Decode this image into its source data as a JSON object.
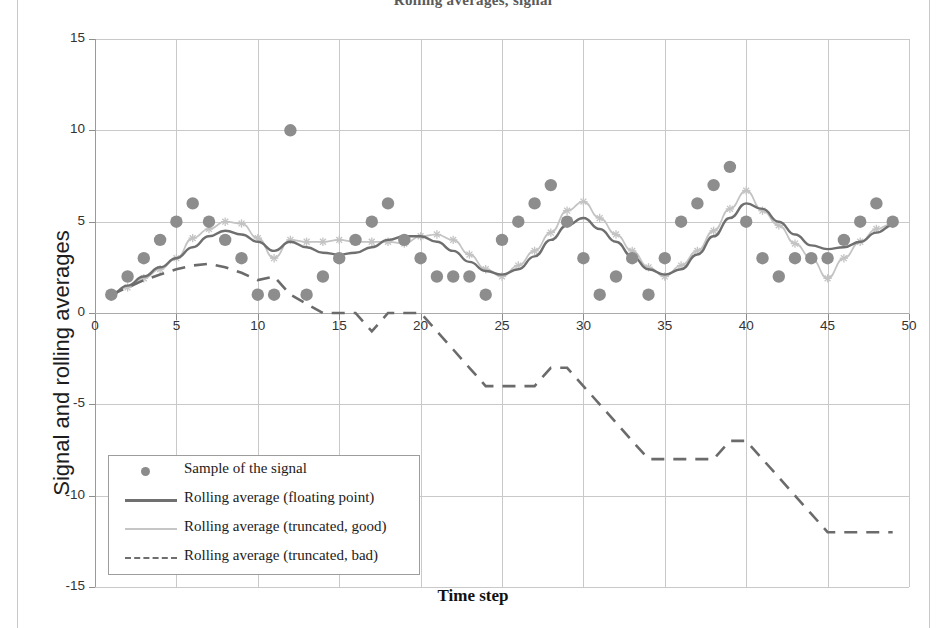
{
  "page": {
    "title_partial": "Rolling averages, signal",
    "background": "#ffffff"
  },
  "axis_labels": {
    "y": "Signal and rolling averages",
    "x": "Time step"
  },
  "legend": {
    "items": [
      {
        "label": "Sample of the signal",
        "key": "marker-dot",
        "color": "#8d8d8d"
      },
      {
        "label": "Rolling average (floating point)",
        "key": "line-solid",
        "color": "#6f6f6f"
      },
      {
        "label": "Rolling average (truncated, good)",
        "key": "line-light",
        "color": "#c3c3c3"
      },
      {
        "label": "Rolling average (truncated, bad)",
        "key": "line-dashed",
        "color": "#6b6b6b"
      }
    ]
  },
  "ticks": {
    "y": [
      "15",
      "10",
      "5",
      "0",
      "-5",
      "-10",
      "-15"
    ],
    "x": [
      "0",
      "5",
      "10",
      "15",
      "20",
      "25",
      "30",
      "35",
      "40",
      "45",
      "50"
    ]
  },
  "chart_data": {
    "type": "scatter",
    "title": "Rolling averages, signal",
    "xlabel": "Time step",
    "ylabel": "Signal and rolling averages",
    "xlim": [
      0,
      50
    ],
    "ylim": [
      -15,
      15
    ],
    "xticks": [
      0,
      5,
      10,
      15,
      20,
      25,
      30,
      35,
      40,
      45,
      50
    ],
    "yticks": [
      -15,
      -10,
      -5,
      0,
      5,
      10,
      15
    ],
    "grid": true,
    "legend_position": "lower-left-inside",
    "x": [
      1,
      2,
      3,
      4,
      5,
      6,
      7,
      8,
      9,
      10,
      11,
      12,
      13,
      14,
      15,
      16,
      17,
      18,
      19,
      20,
      21,
      22,
      23,
      24,
      25,
      26,
      27,
      28,
      29,
      30,
      31,
      32,
      33,
      34,
      35,
      36,
      37,
      38,
      39,
      40,
      41,
      42,
      43,
      44,
      45,
      46,
      47,
      48,
      49
    ],
    "series": [
      {
        "name": "Sample of the signal",
        "type": "scatter",
        "marker": "circle",
        "color": "#8d8d8d",
        "values": [
          1,
          2,
          3,
          4,
          5,
          6,
          5,
          4,
          3,
          1,
          1,
          10,
          1,
          2,
          3,
          4,
          5,
          6,
          4,
          3,
          2,
          2,
          2,
          1,
          4,
          5,
          6,
          7,
          5,
          3,
          1,
          2,
          3,
          1,
          3,
          5,
          6,
          7,
          8,
          5,
          3,
          2,
          3,
          3,
          3,
          4,
          5,
          6,
          5
        ]
      },
      {
        "name": "Rolling average (floating point)",
        "type": "line",
        "color": "#6f6f6f",
        "values": [
          1.0,
          1.5,
          2.0,
          2.5,
          3.0,
          3.6,
          4.2,
          4.5,
          4.3,
          3.9,
          3.4,
          3.9,
          3.6,
          3.3,
          3.2,
          3.3,
          3.6,
          4.0,
          4.2,
          4.2,
          3.9,
          3.4,
          2.8,
          2.3,
          2.1,
          2.4,
          3.1,
          4.0,
          4.8,
          5.2,
          4.6,
          3.9,
          3.1,
          2.4,
          2.1,
          2.4,
          3.2,
          4.2,
          5.2,
          6.0,
          5.7,
          5.0,
          4.3,
          3.7,
          3.5,
          3.6,
          3.9,
          4.4,
          4.8
        ]
      },
      {
        "name": "Rolling average (truncated, good)",
        "type": "line",
        "color": "#c3c3c3",
        "marker": "star",
        "values": [
          1.0,
          1.4,
          1.9,
          2.4,
          3.0,
          4.1,
          4.6,
          5.0,
          4.9,
          4.1,
          3.0,
          4.0,
          3.9,
          3.9,
          4.0,
          3.9,
          3.9,
          3.9,
          3.8,
          4.2,
          4.3,
          4.0,
          3.2,
          2.4,
          2.0,
          2.6,
          3.4,
          4.4,
          5.6,
          6.1,
          5.2,
          4.3,
          3.4,
          2.5,
          2.0,
          2.6,
          3.4,
          4.5,
          5.7,
          6.7,
          5.6,
          4.8,
          3.8,
          3.0,
          1.9,
          3.0,
          3.9,
          4.6,
          4.9
        ]
      },
      {
        "name": "Rolling average (truncated, bad)",
        "type": "line",
        "color": "#6b6b6b",
        "dashed": true,
        "values": [
          1.0,
          1.4,
          1.8,
          2.1,
          2.4,
          2.6,
          2.7,
          2.5,
          2.2,
          1.8,
          2.0,
          1.0,
          0.5,
          0.0,
          0.0,
          0.0,
          -1.0,
          0.0,
          0.0,
          0.0,
          -1.0,
          -2.0,
          -3.0,
          -4.0,
          -4.0,
          -4.0,
          -4.0,
          -3.0,
          -3.0,
          -4.0,
          -5.0,
          -6.0,
          -7.0,
          -8.0,
          -8.0,
          -8.0,
          -8.0,
          -8.0,
          -7.0,
          -7.0,
          -8.0,
          -9.0,
          -10.0,
          -11.0,
          -12.0,
          -12.0,
          -12.0,
          -12.0,
          -12.0
        ]
      }
    ]
  }
}
